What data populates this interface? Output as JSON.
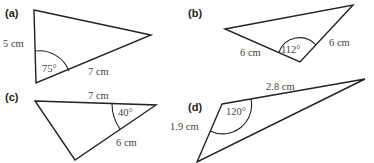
{
  "diagrams": {
    "a": {
      "label": "(a)",
      "side1": "5 cm",
      "side2": "7 cm",
      "angle": "75°"
    },
    "b": {
      "label": "(b)",
      "side1": "6 cm",
      "side2": "6 cm",
      "angle": "112°"
    },
    "c": {
      "label": "(c)",
      "side1": "7 cm",
      "side2": "6 cm",
      "angle": "40°"
    },
    "d": {
      "label": "(d)",
      "side1": "2.8 cm",
      "side2": "1.9 cm",
      "angle": "120°"
    }
  },
  "colors": {
    "stroke": "#222222",
    "text": "#444444",
    "background": "#ffffff"
  }
}
